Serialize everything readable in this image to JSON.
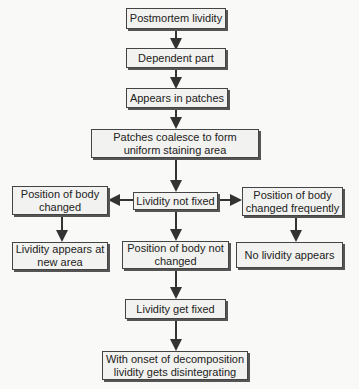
{
  "nodes": {
    "postmortem": "Postmortem lividity",
    "dependent": "Dependent part",
    "patches": "Appears in patches",
    "coalesce": "Patches coalesce to form uniform staining area",
    "not_fixed": "Lividity not fixed",
    "changed": "Position of body changed",
    "changed_freq": "Position of body changed frequently",
    "new_area": "Lividity appears at new area",
    "not_changed": "Position of body not changed",
    "no_lividity": "No lividity appears",
    "get_fixed": "Lividity get fixed",
    "decomposition": "With onset of decomposition lividity gets disintegrating"
  },
  "colors": {
    "box_fill": "#f2f2f0",
    "line": "#333333"
  }
}
